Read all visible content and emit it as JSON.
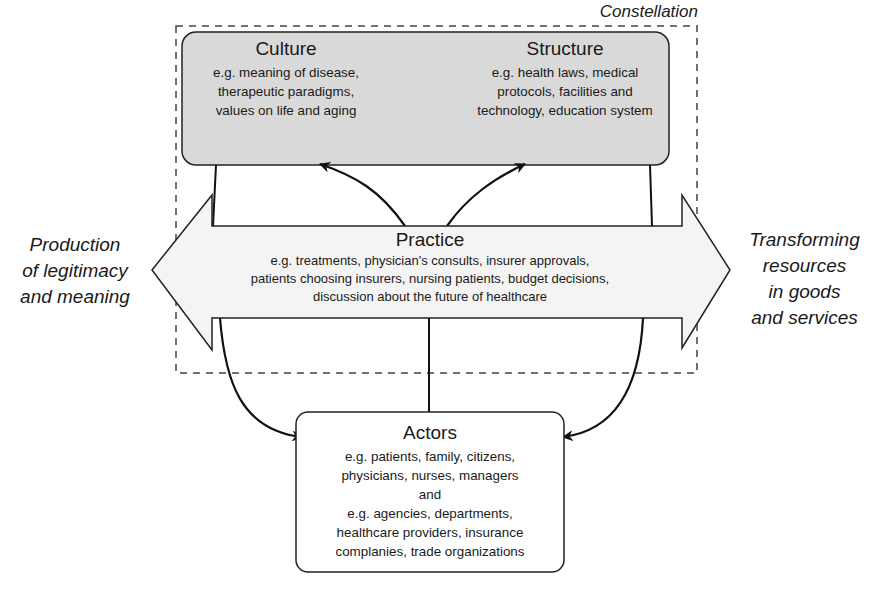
{
  "constellation": {
    "label": "Constellation"
  },
  "culture": {
    "title": "Culture",
    "lines": [
      "e.g. meaning of disease,",
      "therapeutic paradigms,",
      "values on life and aging"
    ]
  },
  "structure": {
    "title": "Structure",
    "lines": [
      "e.g. health laws, medical",
      "protocols, facilities and",
      "technology, education system"
    ]
  },
  "practice": {
    "title": "Practice",
    "lines": [
      "e.g. treatments, physician's consults, insurer approvals,",
      "patients choosing insurers, nursing patients, budget decisions,",
      "discussion about the future of healthcare"
    ]
  },
  "left_label": {
    "lines": [
      "Production",
      "of legitimacy",
      "and meaning"
    ]
  },
  "right_label": {
    "lines": [
      "Transforming",
      "resources",
      "in goods",
      "and services"
    ]
  },
  "actors": {
    "title": "Actors",
    "lines": [
      "e.g. patients, family, citizens,",
      "physicians, nurses, managers",
      "and",
      "e.g. agencies, departments,",
      "healthcare providers, insurance",
      "complanies, trade organizations"
    ]
  },
  "colors": {
    "top_box_fill": "#d9d9d9",
    "arrow_fill": "#f4f4f4",
    "stroke": "#1a1a1a",
    "dash": "#444444"
  }
}
